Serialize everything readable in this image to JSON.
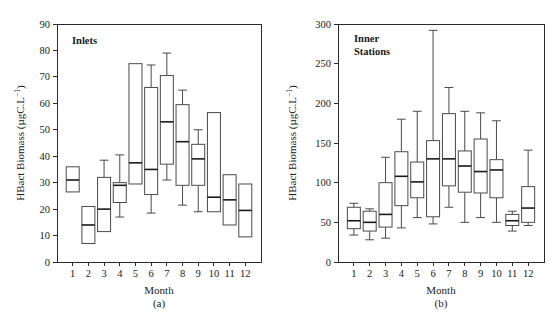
{
  "figure": {
    "background": "#ffffff",
    "line_color": "#4a4a4a",
    "text_color": "#1a1a1a"
  },
  "chart_data": [
    {
      "type": "box",
      "panel_id": "a",
      "panel_letter": "(a)",
      "title": "Inlets",
      "xlabel": "Month",
      "ylabel": "HBact Biomass (µgC.L",
      "ylabel_exponent": "−1",
      "ylabel_suffix": ")",
      "categories": [
        "1",
        "2",
        "3",
        "4",
        "5",
        "6",
        "7",
        "8",
        "9",
        "10",
        "11",
        "12"
      ],
      "ylim": [
        0,
        90
      ],
      "yticks": [
        0,
        10,
        20,
        30,
        40,
        50,
        60,
        70,
        80,
        90
      ],
      "ytick_labels": [
        "0",
        "10",
        "20",
        "30",
        "40",
        "50",
        "60",
        "70",
        "80",
        "90"
      ],
      "grid": false,
      "legend": "none",
      "boxes": [
        {
          "category": "1",
          "whisker_low": 26.5,
          "q1": 26.5,
          "median": 31.0,
          "q3": 36.0,
          "whisker_high": 36.0
        },
        {
          "category": "2",
          "whisker_low": 7.0,
          "q1": 7.0,
          "median": 14.0,
          "q3": 21.0,
          "whisker_high": 21.0
        },
        {
          "category": "3",
          "whisker_low": 11.5,
          "q1": 11.5,
          "median": 20.0,
          "q3": 32.0,
          "whisker_high": 38.5
        },
        {
          "category": "4",
          "whisker_low": 17.0,
          "q1": 22.5,
          "median": 29.0,
          "q3": 30.0,
          "whisker_high": 40.5
        },
        {
          "category": "5",
          "whisker_low": 29.5,
          "q1": 29.5,
          "median": 37.5,
          "q3": 75.0,
          "whisker_high": 75.0
        },
        {
          "category": "6",
          "whisker_low": 18.5,
          "q1": 25.5,
          "median": 35.0,
          "q3": 66.0,
          "whisker_high": 74.5
        },
        {
          "category": "7",
          "whisker_low": 31.0,
          "q1": 37.0,
          "median": 53.0,
          "q3": 70.5,
          "whisker_high": 79.0
        },
        {
          "category": "8",
          "whisker_low": 21.5,
          "q1": 29.0,
          "median": 45.5,
          "q3": 59.5,
          "whisker_high": 65.0
        },
        {
          "category": "9",
          "whisker_low": 19.0,
          "q1": 29.0,
          "median": 39.0,
          "q3": 44.5,
          "whisker_high": 50.0
        },
        {
          "category": "10",
          "whisker_low": 19.0,
          "q1": 19.0,
          "median": 24.5,
          "q3": 56.5,
          "whisker_high": 56.5
        },
        {
          "category": "11",
          "whisker_low": 14.0,
          "q1": 14.0,
          "median": 23.5,
          "q3": 33.0,
          "whisker_high": 33.0
        },
        {
          "category": "12",
          "whisker_low": 9.5,
          "q1": 9.5,
          "median": 19.5,
          "q3": 29.5,
          "whisker_high": 29.5
        }
      ]
    },
    {
      "type": "box",
      "panel_id": "b",
      "panel_letter": "(b)",
      "title_line1": "Inner",
      "title_line2": "Stations",
      "title": "Inner Stations",
      "xlabel": "Month",
      "ylabel": "HBact Biomass (µgC.L",
      "ylabel_exponent": "−1",
      "ylabel_suffix": ")",
      "categories": [
        "1",
        "2",
        "3",
        "4",
        "5",
        "6",
        "7",
        "8",
        "9",
        "10",
        "11",
        "12"
      ],
      "ylim": [
        0,
        300
      ],
      "yticks": [
        0,
        50,
        100,
        150,
        200,
        250,
        300
      ],
      "ytick_labels": [
        "0",
        "50",
        "100",
        "150",
        "200",
        "250",
        "300"
      ],
      "grid": false,
      "legend": "none",
      "boxes": [
        {
          "category": "1",
          "whisker_low": 34,
          "q1": 42,
          "median": 52,
          "q3": 69,
          "whisker_high": 74
        },
        {
          "category": "2",
          "whisker_low": 28,
          "q1": 39,
          "median": 50,
          "q3": 64,
          "whisker_high": 67
        },
        {
          "category": "3",
          "whisker_low": 30,
          "q1": 44,
          "median": 60,
          "q3": 100,
          "whisker_high": 132
        },
        {
          "category": "4",
          "whisker_low": 43,
          "q1": 71,
          "median": 108,
          "q3": 139,
          "whisker_high": 180
        },
        {
          "category": "5",
          "whisker_low": 56,
          "q1": 81,
          "median": 101,
          "q3": 126,
          "whisker_high": 190
        },
        {
          "category": "6",
          "whisker_low": 48,
          "q1": 57,
          "median": 130,
          "q3": 153,
          "whisker_high": 292
        },
        {
          "category": "7",
          "whisker_low": 69,
          "q1": 96,
          "median": 130,
          "q3": 187,
          "whisker_high": 220
        },
        {
          "category": "8",
          "whisker_low": 50,
          "q1": 88,
          "median": 121,
          "q3": 140,
          "whisker_high": 190
        },
        {
          "category": "9",
          "whisker_low": 56,
          "q1": 87,
          "median": 114,
          "q3": 155,
          "whisker_high": 188
        },
        {
          "category": "10",
          "whisker_low": 50,
          "q1": 81,
          "median": 116,
          "q3": 129,
          "whisker_high": 178
        },
        {
          "category": "11",
          "whisker_low": 39,
          "q1": 46,
          "median": 52,
          "q3": 60,
          "whisker_high": 64
        },
        {
          "category": "12",
          "whisker_low": 46,
          "q1": 50,
          "median": 68,
          "q3": 95,
          "whisker_high": 141
        }
      ]
    }
  ]
}
